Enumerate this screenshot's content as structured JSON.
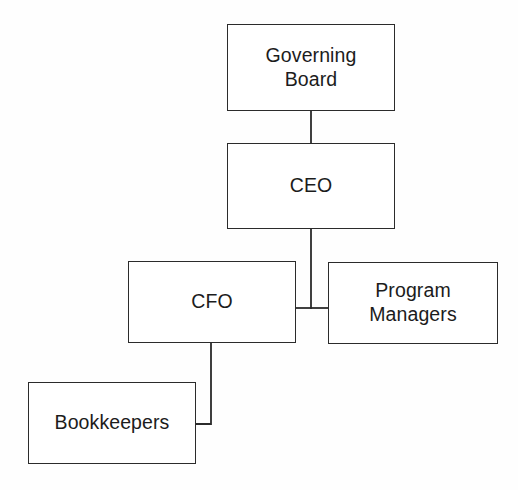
{
  "diagram": {
    "type": "org-chart",
    "background_color": "#fefefe",
    "line_color": "#2b2b2b",
    "text_color": "#1c1c1c",
    "nodes": [
      {
        "id": "governing-board",
        "label": "Governing\nBoard",
        "x": 227,
        "y": 24,
        "width": 168,
        "height": 87,
        "level": 0
      },
      {
        "id": "ceo",
        "label": "CEO",
        "x": 227,
        "y": 143,
        "width": 168,
        "height": 86,
        "level": 1
      },
      {
        "id": "cfo",
        "label": "CFO",
        "x": 128,
        "y": 261,
        "width": 168,
        "height": 82,
        "level": 2
      },
      {
        "id": "program-managers",
        "label": "Program\nManagers",
        "x": 328,
        "y": 262,
        "width": 170,
        "height": 82,
        "level": 2
      },
      {
        "id": "bookkeepers",
        "label": "Bookkeepers",
        "x": 28,
        "y": 382,
        "width": 168,
        "height": 82,
        "level": 3
      }
    ],
    "edges": [
      {
        "id": "edge-governing-board-ceo",
        "from": "governing-board",
        "to": "ceo",
        "style": "straight-vertical"
      },
      {
        "id": "edge-ceo-cfo",
        "from": "ceo",
        "to": "cfo",
        "style": "vertical-then-left"
      },
      {
        "id": "edge-ceo-program-managers",
        "from": "ceo",
        "to": "program-managers",
        "style": "vertical-then-right"
      },
      {
        "id": "edge-cfo-bookkeepers",
        "from": "cfo",
        "to": "bookkeepers",
        "style": "elbow-down-left"
      }
    ]
  }
}
